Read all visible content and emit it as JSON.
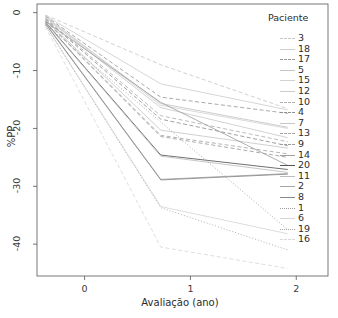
{
  "chart_data": {
    "type": "line",
    "title": "",
    "xlabel": "Avaliação (ano)",
    "ylabel": "%PP",
    "xlim": [
      -0.45,
      2.3
    ],
    "ylim": [
      -45.5,
      1.5
    ],
    "xticks": [
      0,
      1,
      2
    ],
    "xtick_labels": [
      "0",
      "1",
      "2"
    ],
    "yticks": [
      0,
      -10,
      -20,
      -30,
      -40
    ],
    "ytick_labels": [
      "0",
      "-10",
      "-20",
      "-30",
      "-40"
    ],
    "grid": false,
    "legend_position": "right",
    "legend_title": "Paciente",
    "x": [
      -0.37,
      0.72,
      1.92
    ],
    "series": [
      {
        "name": "3",
        "values": [
          -0.4,
          -9.0,
          -16.6
        ],
        "style": "dashed",
        "color": "#c9c9c9"
      },
      {
        "name": "18",
        "values": [
          -0.5,
          -12.3,
          -16.8
        ],
        "style": "solid",
        "color": "#cfcfcf"
      },
      {
        "name": "17",
        "values": [
          -0.6,
          -14.6,
          -17.4
        ],
        "style": "dashed",
        "color": "#9a9a9a"
      },
      {
        "name": "5",
        "values": [
          -0.7,
          -15.7,
          -19.8
        ],
        "style": "solid",
        "color": "#c4c4c4"
      },
      {
        "name": "15",
        "values": [
          -0.8,
          -16.0,
          -20.0
        ],
        "style": "solid",
        "color": "#d2d2d2"
      },
      {
        "name": "12",
        "values": [
          -0.9,
          -16.4,
          -21.6
        ],
        "style": "solid",
        "color": "#cbcbcb"
      },
      {
        "name": "10",
        "values": [
          -1.0,
          -17.8,
          -22.3
        ],
        "style": "dashed",
        "color": "#b0b0b0"
      },
      {
        "name": "4",
        "values": [
          -1.1,
          -18.4,
          -23.0
        ],
        "style": "dashed",
        "color": "#8f8f8f"
      },
      {
        "name": "7",
        "values": [
          -1.2,
          -20.3,
          -23.4
        ],
        "style": "solid",
        "color": "#c7c7c7"
      },
      {
        "name": "13",
        "values": [
          -1.3,
          -21.2,
          -24.4
        ],
        "style": "dashed",
        "color": "#a8a8a8"
      },
      {
        "name": "9",
        "values": [
          -1.4,
          -21.4,
          -25.0
        ],
        "style": "dashed",
        "color": "#9c9c9c"
      },
      {
        "name": "14",
        "values": [
          -1.5,
          -15.5,
          -26.4
        ],
        "style": "solid",
        "color": "#a0a0a0"
      },
      {
        "name": "20",
        "values": [
          -1.6,
          -24.6,
          -27.1
        ],
        "style": "solid",
        "color": "#555555"
      },
      {
        "name": "11",
        "values": [
          -1.7,
          -24.8,
          -27.6
        ],
        "style": "solid",
        "color": "#bdbdbd"
      },
      {
        "name": "2",
        "values": [
          -1.8,
          -28.8,
          -27.8
        ],
        "style": "solid",
        "color": "#a6a6a6"
      },
      {
        "name": "8",
        "values": [
          -1.9,
          -28.9,
          -27.9
        ],
        "style": "solid",
        "color": "#8a8a8a"
      },
      {
        "name": "1",
        "values": [
          -2.0,
          -18.9,
          -37.5
        ],
        "style": "dotted",
        "color": "#9e9e9e"
      },
      {
        "name": "6",
        "values": [
          -2.1,
          -33.5,
          -38.2
        ],
        "style": "solid",
        "color": "#d6d6d6"
      },
      {
        "name": "19",
        "values": [
          -2.2,
          -33.7,
          -41.0
        ],
        "style": "dotted",
        "color": "#a3a3a3"
      },
      {
        "name": "16",
        "values": [
          -2.4,
          -40.5,
          -44.2
        ],
        "style": "dashed",
        "color": "#d8d8d8"
      }
    ]
  },
  "axes": {
    "xlabel": "Avaliação (ano)",
    "ylabel": "%PP"
  },
  "legend": {
    "title": "Paciente",
    "items": [
      "3",
      "18",
      "17",
      "5",
      "15",
      "12",
      "10",
      "4",
      "7",
      "13",
      "9",
      "14",
      "20",
      "11",
      "2",
      "8",
      "1",
      "6",
      "19",
      "16"
    ]
  },
  "colors": {
    "axis": "#555555",
    "text": "#2b2b2b",
    "background": "#ffffff"
  }
}
